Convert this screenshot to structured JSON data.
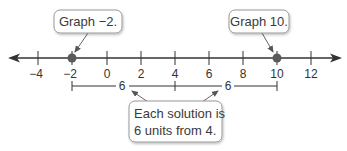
{
  "number_line": {
    "min": -5,
    "max": 13,
    "ticks": [
      -4,
      -2,
      0,
      2,
      4,
      6,
      8,
      10,
      12
    ],
    "tick_labels": [
      "−4",
      "−2",
      "0",
      "2",
      "4",
      "6",
      "8",
      "10",
      "12"
    ],
    "points": [
      -2,
      10
    ],
    "point_color": "#5a5a5a",
    "line_color": "#333333"
  },
  "callouts": {
    "left": "Graph −2.",
    "right": "Graph 10.",
    "bottom_line1": "Each solution is",
    "bottom_line2": "6 units from 4."
  },
  "bracket": {
    "start": -2,
    "mid": 4,
    "end": 10,
    "left_label": "6",
    "right_label": "6"
  }
}
